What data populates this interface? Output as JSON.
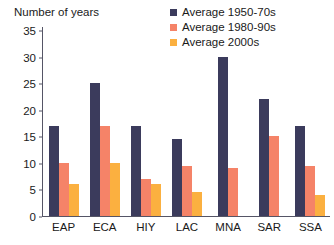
{
  "chart_data": {
    "type": "bar",
    "title": "Number of years",
    "xlabel": "",
    "ylabel": "Number of years",
    "ylim": [
      0,
      35
    ],
    "yticks": [
      0,
      5,
      10,
      15,
      20,
      25,
      30,
      35
    ],
    "grid": false,
    "legend_position": "top-right",
    "categories": [
      "EAP",
      "ECA",
      "HIY",
      "LAC",
      "MNA",
      "SAR",
      "SSA"
    ],
    "series": [
      {
        "name": "Average 1950-70s",
        "color": "#3b3b5c",
        "values": [
          17,
          25,
          17,
          14.5,
          30,
          22,
          17
        ]
      },
      {
        "name": "Average 1980-90s",
        "color": "#f58368",
        "values": [
          10,
          17,
          7,
          9.5,
          9,
          15,
          9.5
        ]
      },
      {
        "name": "Average 2000s",
        "color": "#fbb040",
        "values": [
          6,
          10,
          6,
          4.5,
          null,
          null,
          4
        ]
      }
    ]
  }
}
